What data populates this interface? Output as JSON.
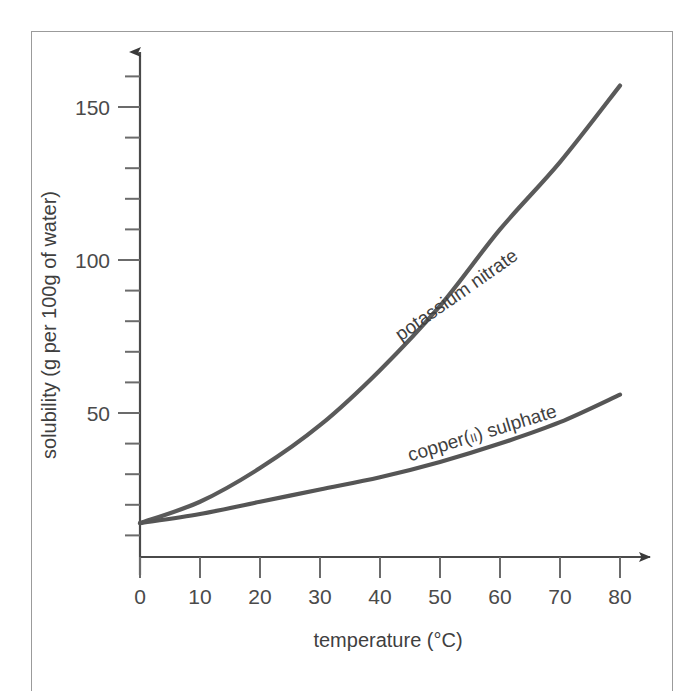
{
  "chart_data": {
    "type": "line",
    "title": "",
    "subtitle": "",
    "xlabel": "temperature (°C)",
    "ylabel": "solubility (g per 100g of water)",
    "xlim": [
      0,
      80
    ],
    "ylim": [
      0,
      165
    ],
    "grid": false,
    "legend_position": "inline-curve-labels",
    "x_ticks": [
      0,
      10,
      20,
      30,
      40,
      50,
      60,
      70,
      80
    ],
    "x_tick_labels": [
      "0",
      "10",
      "20",
      "30",
      "40",
      "50",
      "60",
      "70",
      "80"
    ],
    "y_ticks_major": [
      50,
      100,
      150
    ],
    "y_tick_labels": [
      "50",
      "100",
      "150"
    ],
    "y_ticks_minor": [
      10,
      20,
      30,
      40,
      60,
      70,
      80,
      90,
      110,
      120,
      130,
      140,
      160
    ],
    "x": [
      0,
      10,
      20,
      30,
      40,
      50,
      60,
      70,
      80
    ],
    "series": [
      {
        "name": "potassium nitrate",
        "label": "potassium nitrate",
        "color": "#5a5a5a",
        "values": [
          14,
          21,
          32,
          46,
          64,
          85,
          110,
          132,
          157
        ]
      },
      {
        "name": "copper(II) sulphate",
        "label_main": "copper(",
        "label_roman": "II",
        "label_tail": ") sulphate",
        "label": "copper(II) sulphate",
        "color": "#555555",
        "values": [
          14,
          17,
          21,
          25,
          29,
          34,
          40,
          47,
          56
        ]
      }
    ],
    "annotations": [
      {
        "text": "potassium nitrate",
        "attached_to": "potassium nitrate",
        "rotation_deg": -35
      },
      {
        "text": "copper(II) sulphate",
        "attached_to": "copper(II) sulphate",
        "rotation_deg": -17
      }
    ]
  },
  "axis_titles": {
    "x": "temperature (°C)",
    "y": "solubility (g per 100g of water)"
  },
  "colors": {
    "frame": "#9b9b9b",
    "axis": "#4a4a4a",
    "text": "#3f3f3f",
    "curve_potassium_nitrate": "#5a5a5a",
    "curve_copper_sulphate": "#555555",
    "background": "#ffffff"
  },
  "icons": {
    "y_axis_arrow": "arrow-up-icon",
    "x_axis_arrow": "arrow-right-icon"
  }
}
